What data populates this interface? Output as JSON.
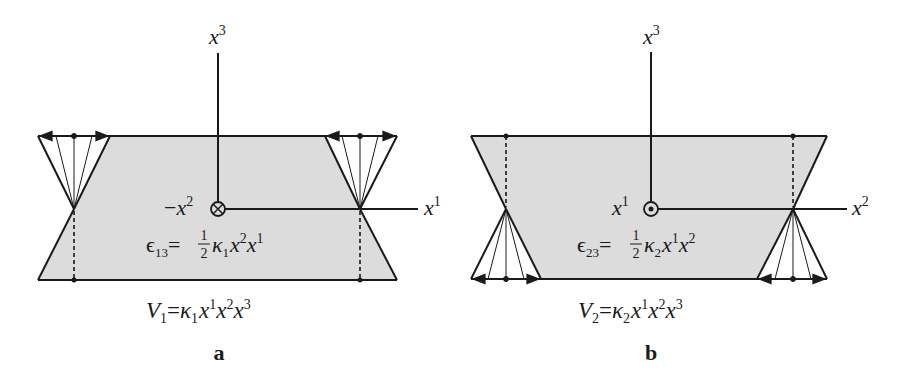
{
  "colors": {
    "ink": "#1a1a1a",
    "fill": "#dcdcdc",
    "background": "#ffffff"
  },
  "panel_a": {
    "letter": "a",
    "axis_vertical": {
      "base": "x",
      "sup": "3"
    },
    "axis_horizontal": {
      "base": "x",
      "sup": "1"
    },
    "axis_out_of_page": {
      "prefix": "−",
      "base": "x",
      "sup": "2",
      "symbol": "circled-times"
    },
    "strain": {
      "lhs": "ϵ",
      "lhs_sub": "13",
      "eq": "=",
      "frac_num": "1",
      "frac_den": "2",
      "kappa": "κ",
      "kappa_sub": "1",
      "t1": "x",
      "t1_sup": "2",
      "t2": "x",
      "t2_sup": "1"
    },
    "displacement": {
      "lhs": "V",
      "lhs_sub": "1",
      "eq": "=",
      "kappa": "κ",
      "kappa_sub": "1",
      "t1": "x",
      "t1_sup": "1",
      "t2": "x",
      "t2_sup": "2",
      "t3": "x",
      "t3_sup": "3"
    }
  },
  "panel_b": {
    "letter": "b",
    "axis_vertical": {
      "base": "x",
      "sup": "3"
    },
    "axis_horizontal": {
      "base": "x",
      "sup": "2"
    },
    "axis_out_of_page": {
      "prefix": "",
      "base": "x",
      "sup": "1",
      "symbol": "circled-dot"
    },
    "strain": {
      "lhs": "ϵ",
      "lhs_sub": "23",
      "eq": "=",
      "frac_num": "1",
      "frac_den": "2",
      "kappa": "κ",
      "kappa_sub": "2",
      "t1": "x",
      "t1_sup": "1",
      "t2": "x",
      "t2_sup": "2"
    },
    "displacement": {
      "lhs": "V",
      "lhs_sub": "2",
      "eq": "=",
      "kappa": "κ",
      "kappa_sub": "2",
      "t1": "x",
      "t1_sup": "1",
      "t2": "x",
      "t2_sup": "2",
      "t3": "x",
      "t3_sup": "3"
    }
  }
}
